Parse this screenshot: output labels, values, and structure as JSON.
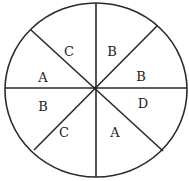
{
  "diagram": {
    "type": "spinner",
    "sector_count": 8,
    "sectors": [
      {
        "label": "C"
      },
      {
        "label": "B"
      },
      {
        "label": "B"
      },
      {
        "label": "D"
      },
      {
        "label": "A"
      },
      {
        "label": "C"
      },
      {
        "label": "B"
      },
      {
        "label": "A"
      }
    ]
  }
}
